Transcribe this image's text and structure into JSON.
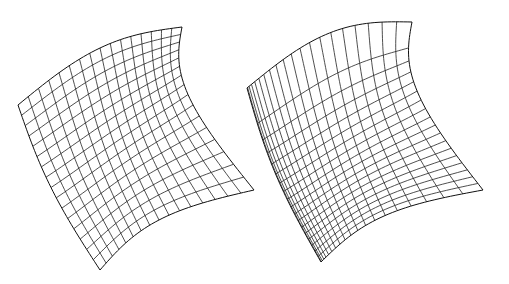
{
  "figure": {
    "background": "#ffffff",
    "stroke_color": "#222222",
    "panels": [
      {
        "id": "left-surface",
        "description": "Wireframe saddle-like surface patch with uniform parameterization",
        "corners": {
          "p00": [
            18,
            105
          ],
          "p10": [
            182,
            27
          ],
          "p01": [
            100,
            270
          ],
          "p11": [
            254,
            190
          ]
        },
        "bulge": {
          "top": [
            95,
            -18
          ],
          "left": [
            8,
            30
          ],
          "interior": [
            30,
            10
          ]
        },
        "u_lines": 17,
        "v_lines": 17,
        "u_warp": 1.0,
        "v_warp": 1.0
      },
      {
        "id": "right-surface",
        "description": "Same surface patch with non-uniform parameterization (dense on left/bottom, sparse top-right)",
        "corners": {
          "p00": [
            247,
            88
          ],
          "p10": [
            412,
            22
          ],
          "p01": [
            321,
            262
          ],
          "p11": [
            483,
            190
          ]
        },
        "bulge": {
          "top": [
            100,
            -22
          ],
          "left": [
            8,
            28
          ],
          "interior": [
            30,
            10
          ]
        },
        "u_lines": 21,
        "v_lines": 19,
        "u_warp": 1.9,
        "v_warp": 0.55
      }
    ]
  }
}
